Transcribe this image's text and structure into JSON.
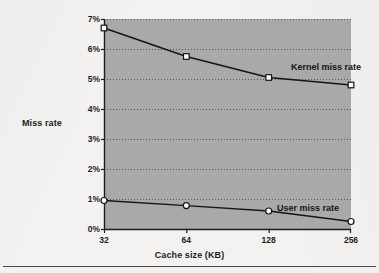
{
  "figure": {
    "plot_fill_color": "#a9a9a9",
    "axis_color": "#1d1d1d",
    "line_color": "#141414",
    "marker_fill_color": "#ffffff",
    "page_color": "#f3f2f0"
  },
  "chart_data": {
    "type": "line",
    "title": "",
    "xlabel": "Cache size (KB)",
    "ylabel": "Miss rate",
    "categories": [
      "32",
      "64",
      "128",
      "256"
    ],
    "x": [
      32,
      64,
      128,
      256
    ],
    "xscale": "log2-categorical",
    "xtick_labels": [
      "32",
      "64",
      "128",
      "256"
    ],
    "ytick_labels": [
      "0%",
      "1%",
      "2%",
      "3%",
      "4%",
      "5%",
      "6%",
      "7%"
    ],
    "ytick_values": [
      0,
      1,
      2,
      3,
      4,
      5,
      6,
      7
    ],
    "ylim": [
      0,
      7
    ],
    "yunit": "%",
    "grid": true,
    "grid_style": "dotted-horizontal",
    "legend_position": "inline-right-of-series",
    "series": [
      {
        "name": "Kernel miss rate",
        "marker": "open-square",
        "values": [
          6.7,
          5.75,
          5.05,
          4.8
        ]
      },
      {
        "name": "User miss rate",
        "marker": "open-circle",
        "values": [
          0.95,
          0.78,
          0.6,
          0.25
        ]
      }
    ]
  }
}
